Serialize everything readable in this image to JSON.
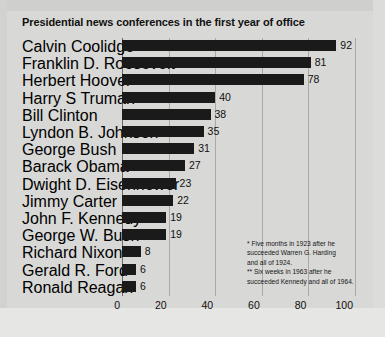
{
  "chart_data": {
    "type": "bar",
    "orientation": "horizontal",
    "title": "Presidential news conferences in the first year of office",
    "xlabel": "",
    "ylabel": "",
    "xlim": [
      0,
      100
    ],
    "xticks": [
      0,
      20,
      40,
      60,
      80,
      100
    ],
    "grid": true,
    "legend": null,
    "bar_color": "#1a1a1a",
    "background_color": "#d8d8d6",
    "categories": [
      "Calvin Coolidge*",
      "Franklin D. Roosevelt",
      "Herbert Hoover",
      "Harry S Truman",
      "Bill Clinton",
      "Lyndon B. Johnson**",
      "George Bush",
      "Barack Obama",
      "Dwight D. Eisenhower",
      "Jimmy Carter",
      "John F. Kennedy",
      "George W. Bush",
      "Richard Nixon",
      "Gerald R. Ford",
      "Ronald Reagan"
    ],
    "values": [
      92,
      81,
      78,
      40,
      38,
      35,
      31,
      27,
      23,
      22,
      19,
      19,
      8,
      6,
      6
    ],
    "annotations": [
      "* Five months in 1923 after he",
      "succeeded Warren G. Harding",
      "and all of 1924.",
      "** Six weeks in 1963 after he",
      "succeeded Kennedy and all of 1964."
    ]
  }
}
